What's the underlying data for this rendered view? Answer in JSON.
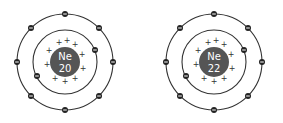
{
  "atoms": [
    {
      "element": "Ne",
      "mass": "20",
      "cx": 65,
      "cy": 62
    },
    {
      "element": "Ne",
      "mass": "22",
      "cx": 214,
      "cy": 62
    }
  ],
  "shells": {
    "inner_electrons": 2,
    "outer_electrons": 8
  },
  "colors": {
    "nucleus": "#555555",
    "electron": "#222222",
    "shell": "#333333"
  }
}
